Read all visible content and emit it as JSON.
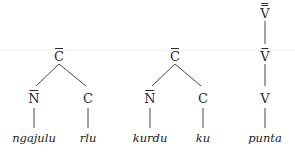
{
  "trees": [
    {
      "root": {
        "label": "C",
        "bars": 1
      },
      "children": [
        {
          "label": "N",
          "bars": 1,
          "word": "ngajulu"
        },
        {
          "label": "C",
          "bars": 0,
          "word": "rlu"
        }
      ]
    },
    {
      "root": {
        "label": "C",
        "bars": 1
      },
      "children": [
        {
          "label": "N",
          "bars": 1,
          "word": "kurdu"
        },
        {
          "label": "C",
          "bars": 0,
          "word": "ku"
        }
      ]
    },
    {
      "chain": [
        {
          "label": "V",
          "bars": 2
        },
        {
          "label": "V",
          "bars": 1
        },
        {
          "label": "V",
          "bars": 0
        }
      ],
      "word": "punta"
    }
  ],
  "colors": {
    "ink": "#2a2a2a",
    "background": "#ffffff"
  }
}
